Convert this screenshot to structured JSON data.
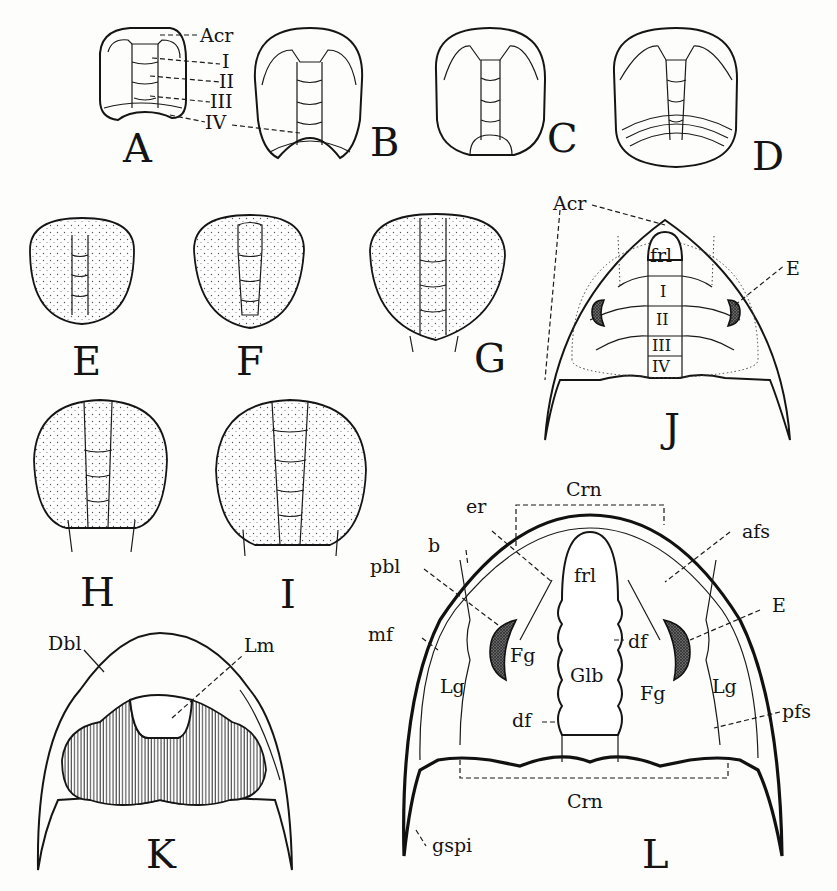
{
  "figure": {
    "type": "scientific-illustration",
    "panels": [
      {
        "id": "A",
        "label": "A",
        "callouts": [
          "Acr",
          "I",
          "II",
          "III",
          "IV"
        ]
      },
      {
        "id": "B",
        "label": "B",
        "callouts": []
      },
      {
        "id": "C",
        "label": "C",
        "callouts": []
      },
      {
        "id": "D",
        "label": "D",
        "callouts": []
      },
      {
        "id": "E",
        "label": "E",
        "callouts": []
      },
      {
        "id": "F",
        "label": "F",
        "callouts": []
      },
      {
        "id": "G",
        "label": "G",
        "callouts": []
      },
      {
        "id": "H",
        "label": "H",
        "callouts": []
      },
      {
        "id": "I",
        "label": "I",
        "callouts": []
      },
      {
        "id": "J",
        "label": "J",
        "callouts": [
          "Acr",
          "frl",
          "I",
          "II",
          "III",
          "IV",
          "E"
        ]
      },
      {
        "id": "K",
        "label": "K",
        "callouts": [
          "Dbl",
          "Lm"
        ]
      },
      {
        "id": "L",
        "label": "L",
        "callouts": [
          "Crn",
          "er",
          "b",
          "pbl",
          "mf",
          "afs",
          "E",
          "frl",
          "df",
          "Fg",
          "Glb",
          "Lg",
          "pfs",
          "Crn",
          "gspi"
        ]
      }
    ]
  },
  "labels": {
    "A": "A",
    "B": "B",
    "C": "C",
    "D": "D",
    "E": "E",
    "F": "F",
    "G": "G",
    "H": "H",
    "I": "I",
    "J": "J",
    "K": "K",
    "L": "L",
    "a_acr": "Acr",
    "a_i": "I",
    "a_ii": "II",
    "a_iii": "III",
    "a_iv": "IV",
    "j_acr": "Acr",
    "j_frl": "frl",
    "j_i": "I",
    "j_ii": "II",
    "j_iii": "III",
    "j_iv": "IV",
    "j_e": "E",
    "k_dbl": "Dbl",
    "k_lm": "Lm",
    "l_crn_top": "Crn",
    "l_er": "er",
    "l_b": "b",
    "l_pbl": "pbl",
    "l_mf": "mf",
    "l_afs": "afs",
    "l_e": "E",
    "l_frl": "frl",
    "l_df_r": "df",
    "l_fg_l": "Fg",
    "l_glb": "Glb",
    "l_lg_l": "Lg",
    "l_lg_r": "Lg",
    "l_fg_r": "Fg",
    "l_pfs": "pfs",
    "l_df_l": "df",
    "l_crn_bot": "Crn",
    "l_gspi": "gspi"
  },
  "caption": ""
}
